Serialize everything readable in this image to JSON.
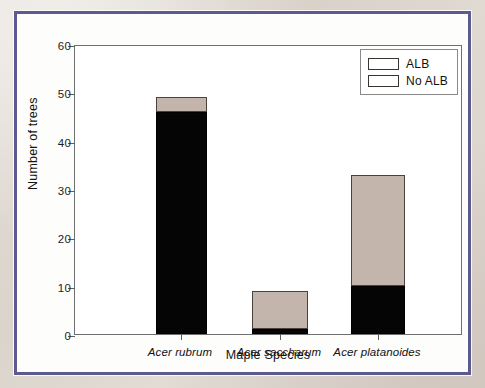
{
  "figure": {
    "frame_color": "#5c5a8e",
    "background_color": "#ded7cf",
    "panel_background": "#ffffff"
  },
  "chart_data": {
    "type": "bar",
    "subtype": "stacked",
    "title": "",
    "xlabel": "Maple Species",
    "ylabel": "Number of trees",
    "categories": [
      "Acer rubrum",
      "Acer saccharum",
      "Acer platanoides"
    ],
    "series": [
      {
        "name": "ALB",
        "color": "#050505",
        "values": [
          46,
          1,
          10
        ]
      },
      {
        "name": "No ALB",
        "color": "#c4b5ac",
        "values": [
          3,
          8,
          23
        ]
      }
    ],
    "totals": [
      49,
      9,
      33
    ],
    "ylim": [
      0,
      60
    ],
    "yticks": [
      0,
      10,
      20,
      30,
      40,
      50,
      60
    ],
    "ytick_labels": [
      "0",
      "10",
      "20",
      "30",
      "40",
      "50",
      "60"
    ],
    "grid": false,
    "legend_position": "top-right",
    "categories_italic": true
  },
  "legend": {
    "entries": [
      {
        "label": "ALB",
        "color": "#050505"
      },
      {
        "label": "No ALB",
        "color": "#c4b5ac"
      }
    ]
  }
}
